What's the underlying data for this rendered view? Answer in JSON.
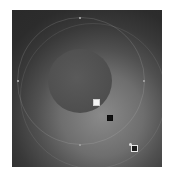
{
  "editor": {
    "tool": "radial-gradient",
    "colors": {
      "inner": "#8a8a8a",
      "outer": "#262626",
      "focal_circle": "#4e4e4e",
      "handle_light": "#f4f4f4",
      "handle_dark": "#111111"
    },
    "handles": [
      {
        "name": "focus-handle",
        "icon": "square-filled-white"
      },
      {
        "name": "center-handle",
        "icon": "square-filled-black"
      },
      {
        "name": "radius-handle",
        "icon": "square-outline"
      }
    ],
    "ring_markers": [
      "top",
      "left",
      "right",
      "bottom"
    ]
  }
}
